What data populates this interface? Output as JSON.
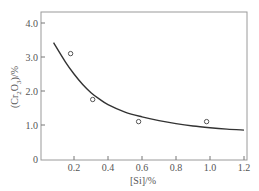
{
  "chart_data": {
    "type": "scatter",
    "title": "",
    "xlabel": "[Si]/%",
    "ylabel": "(Cr2O3)/%",
    "ylabel_parts": {
      "pre": "(Cr",
      "sub1": "2",
      "mid": "O",
      "sub2": "3",
      "post": ")/%"
    },
    "xlim": [
      0,
      1.2
    ],
    "ylim": [
      0,
      4.3
    ],
    "xticks": [
      0.2,
      0.4,
      0.6,
      0.8,
      1.0,
      1.2
    ],
    "xtick_labels": [
      "0.2",
      "0.4",
      "0.6",
      "0.8",
      "1.0",
      "1.2"
    ],
    "yticks": [
      0,
      1.0,
      2.0,
      3.0,
      4.0
    ],
    "ytick_labels": [
      "0",
      "1.0",
      "2.0",
      "3.0",
      "4.0"
    ],
    "grid": false,
    "series": [
      {
        "name": "measured",
        "kind": "scatter",
        "marker": "open-circle",
        "x": [
          0.18,
          0.31,
          0.58,
          0.98
        ],
        "y": [
          3.1,
          1.75,
          1.1,
          1.1
        ]
      },
      {
        "name": "fit",
        "kind": "line",
        "x": [
          0.08,
          0.15,
          0.2,
          0.25,
          0.3,
          0.35,
          0.4,
          0.5,
          0.6,
          0.7,
          0.8,
          0.9,
          1.0,
          1.1,
          1.2
        ],
        "y": [
          3.42,
          2.85,
          2.5,
          2.2,
          1.95,
          1.76,
          1.6,
          1.38,
          1.24,
          1.13,
          1.04,
          0.97,
          0.92,
          0.88,
          0.85
        ]
      }
    ]
  }
}
